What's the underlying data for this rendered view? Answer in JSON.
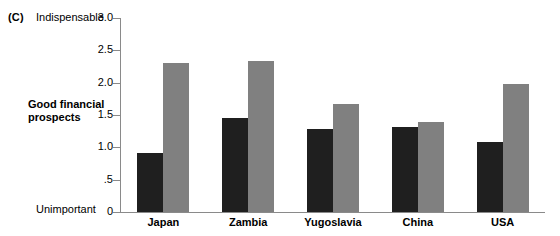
{
  "figure": {
    "panel_letter": "(C)",
    "axis_title": "Good financial prospects",
    "top_anchor_label": "Indispensable",
    "bottom_anchor_label": "Unimportant"
  },
  "colors": {
    "series_dark": "#1f1f1f",
    "series_light": "#808080",
    "axis": "#8a8a8a",
    "background": "#ffffff"
  },
  "chart_data": {
    "type": "bar",
    "title": "",
    "xlabel": "",
    "ylabel": "Good financial prospects",
    "ylim": [
      0,
      3.0
    ],
    "ytick_labels": [
      "0",
      ".5",
      "1.0",
      "1.5",
      "2.0",
      "2.5",
      "3.0"
    ],
    "ytick_values": [
      0,
      0.5,
      1.0,
      1.5,
      2.0,
      2.5,
      3.0
    ],
    "grid": false,
    "legend_position": "none",
    "axis_anchor_low": "Unimportant",
    "axis_anchor_high": "Indispensable",
    "categories": [
      "Japan",
      "Zambia",
      "Yugoslavia",
      "China",
      "USA"
    ],
    "series": [
      {
        "name": "dark",
        "values": [
          0.91,
          1.46,
          1.28,
          1.31,
          1.08
        ]
      },
      {
        "name": "light",
        "values": [
          2.3,
          2.34,
          1.67,
          1.39,
          1.98
        ]
      }
    ]
  }
}
